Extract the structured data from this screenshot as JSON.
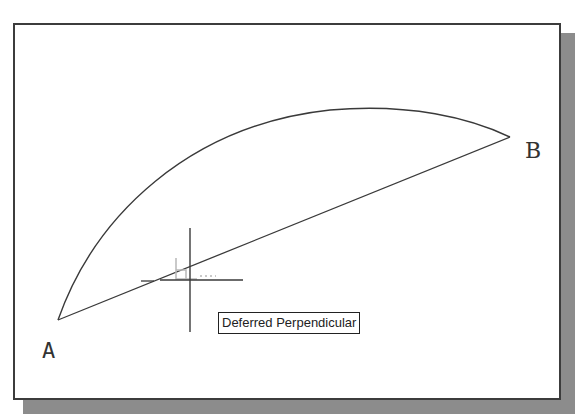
{
  "drawing": {
    "points": {
      "a": {
        "label": "A",
        "x": 58,
        "y": 320
      },
      "b": {
        "label": "B",
        "x": 510,
        "y": 137
      }
    },
    "arc": {
      "from": "A",
      "to": "B",
      "peak": {
        "x": 370,
        "y": 109
      }
    },
    "chord": {
      "from": "A",
      "to": "B"
    }
  },
  "cursor": {
    "type": "crosshair",
    "x": 190,
    "y": 280,
    "snap_marker_icon": "perpendicular-snap-icon"
  },
  "tooltip": {
    "text": "Deferred Perpendicular"
  },
  "colors": {
    "line": "#3a3a3a",
    "frame_border": "#3c3c3c",
    "shadow": "#8c8c8c",
    "snap_marker": "#b8b8b8"
  }
}
